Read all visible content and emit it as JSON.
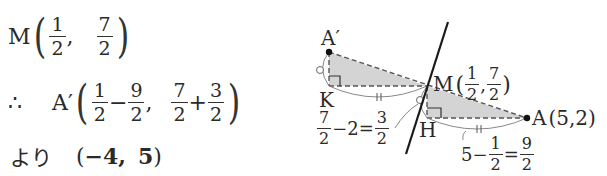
{
  "solution": {
    "line1": {
      "point": "M",
      "x": {
        "num": "1",
        "den": "2"
      },
      "sep": ",",
      "y": {
        "num": "7",
        "den": "2"
      }
    },
    "line2": {
      "therefore": "∴",
      "point": "A′",
      "x_term1": {
        "num": "1",
        "den": "2"
      },
      "x_op": "−",
      "x_term2": {
        "num": "9",
        "den": "2"
      },
      "sep": ",",
      "y_term1": {
        "num": "7",
        "den": "2"
      },
      "y_op": "+",
      "y_term2": {
        "num": "3",
        "den": "2"
      }
    },
    "line3": {
      "prefix": "より",
      "open": "(",
      "x": "−4,",
      "y": "5",
      "close": ")"
    }
  },
  "diagram": {
    "points": {
      "A_prime": {
        "label": "A′"
      },
      "K": {
        "label": "K"
      },
      "M": {
        "label": "M",
        "coords_open": "(",
        "x": {
          "num": "1",
          "den": "2"
        },
        "sep": ",",
        "y": {
          "num": "7",
          "den": "2"
        },
        "coords_close": ")"
      },
      "H": {
        "label": "H"
      },
      "A": {
        "label": "A",
        "coords": "(5,2)"
      }
    },
    "annotations": {
      "vertical_diff": {
        "a": {
          "num": "7",
          "den": "2"
        },
        "op": "−2=",
        "b": {
          "num": "3",
          "den": "2"
        }
      },
      "horizontal_diff": {
        "lead": "5−",
        "a": {
          "num": "1",
          "den": "2"
        },
        "op": "=",
        "b": {
          "num": "9",
          "den": "2"
        }
      }
    },
    "marks": {
      "equal_tick": "∥",
      "equal_circle": "○"
    },
    "colors": {
      "fill": "#d4d4d4",
      "line": "#222222",
      "dashed": "#555555",
      "arc": "#777777"
    }
  }
}
